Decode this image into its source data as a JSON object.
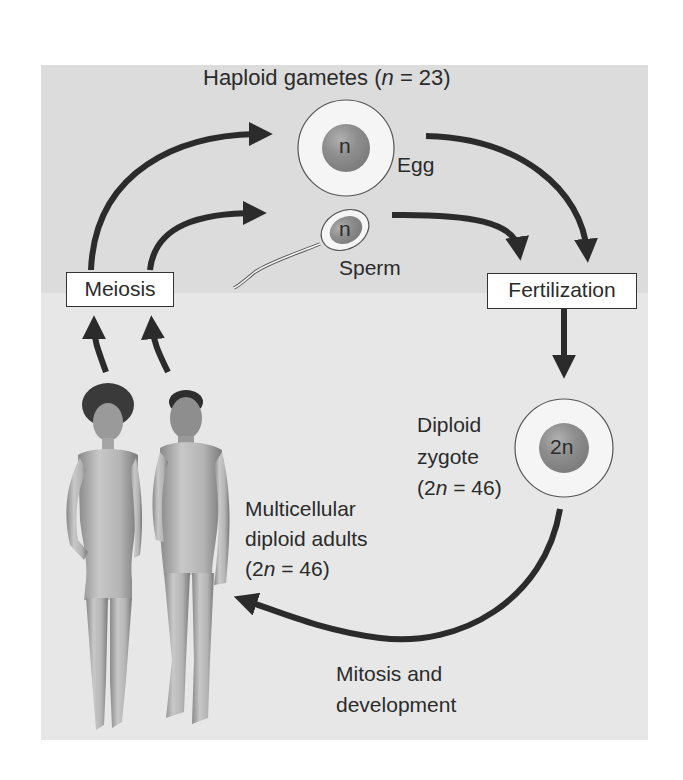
{
  "title": {
    "prefix": "Haploid gametes (",
    "var": "n",
    "suffix": " = 23)"
  },
  "gametes": {
    "egg": {
      "label": "Egg",
      "nucleus_label": "n"
    },
    "sperm": {
      "label": "Sperm",
      "nucleus_label": "n"
    }
  },
  "processes": {
    "meiosis": "Meiosis",
    "fertilization": "Fertilization",
    "mitosis_line1": "Mitosis and",
    "mitosis_line2": "development"
  },
  "zygote": {
    "nucleus_label": "2n",
    "line1": "Diploid",
    "line2": "zygote",
    "line3_prefix": "(2",
    "line3_var": "n",
    "line3_suffix": " = 46)"
  },
  "adults": {
    "line1": "Multicellular",
    "line2": "diploid adults",
    "line3_prefix": "(2",
    "line3_var": "n",
    "line3_suffix": " = 46)"
  },
  "colors": {
    "panel_top": "#dcdcdc",
    "panel_bottom": "#e7e7e7",
    "arrow": "#2b2b2b",
    "nucleus": "#8e8e8e",
    "cell": "#f4f4f4"
  }
}
